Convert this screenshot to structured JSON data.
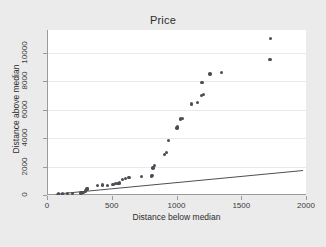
{
  "chart_data": {
    "type": "scatter",
    "title": "Price",
    "xlabel": "Distance below median",
    "ylabel": "Distance above median",
    "xlim": [
      0,
      2000
    ],
    "ylim": [
      0,
      11600
    ],
    "xticks": [
      0,
      500,
      1000,
      1500,
      2000
    ],
    "yticks": [
      0,
      2000,
      4000,
      6000,
      8000,
      10000
    ],
    "xtick_labels": [
      "0",
      "500",
      "1000",
      "1500",
      "2000"
    ],
    "ytick_labels": [
      "0",
      "2000",
      "4000",
      "6000",
      "8000",
      "10000"
    ],
    "grid": "horizontal",
    "legend": "none",
    "marker_color": "#4c4c55",
    "line_color": "#3a3a3a",
    "plot_background": "#ffffff",
    "figure_background": "#ebebeb",
    "series": [
      {
        "name": "observations",
        "type": "scatter",
        "points": [
          [
            80,
            60
          ],
          [
            110,
            70
          ],
          [
            150,
            90
          ],
          [
            190,
            100
          ],
          [
            255,
            140
          ],
          [
            265,
            160
          ],
          [
            275,
            200
          ],
          [
            290,
            280
          ],
          [
            300,
            430
          ],
          [
            305,
            470
          ],
          [
            380,
            680
          ],
          [
            420,
            700
          ],
          [
            460,
            690
          ],
          [
            500,
            740
          ],
          [
            520,
            800
          ],
          [
            540,
            820
          ],
          [
            550,
            860
          ],
          [
            575,
            1080
          ],
          [
            600,
            1160
          ],
          [
            625,
            1220
          ],
          [
            720,
            1320
          ],
          [
            800,
            1330
          ],
          [
            805,
            1380
          ],
          [
            810,
            1900
          ],
          [
            820,
            2060
          ],
          [
            900,
            2840
          ],
          [
            915,
            3010
          ],
          [
            930,
            3820
          ],
          [
            995,
            4700
          ],
          [
            1000,
            4800
          ],
          [
            1025,
            5350
          ],
          [
            1040,
            5380
          ],
          [
            1110,
            6400
          ],
          [
            1155,
            6500
          ],
          [
            1185,
            7000
          ],
          [
            1200,
            7050
          ],
          [
            1190,
            7920
          ],
          [
            1250,
            8500
          ],
          [
            1340,
            8600
          ],
          [
            1715,
            9550
          ],
          [
            1720,
            11000
          ]
        ]
      },
      {
        "name": "reference-line",
        "type": "line",
        "points": [
          [
            60,
            60
          ],
          [
            1970,
            1720
          ]
        ]
      }
    ]
  }
}
